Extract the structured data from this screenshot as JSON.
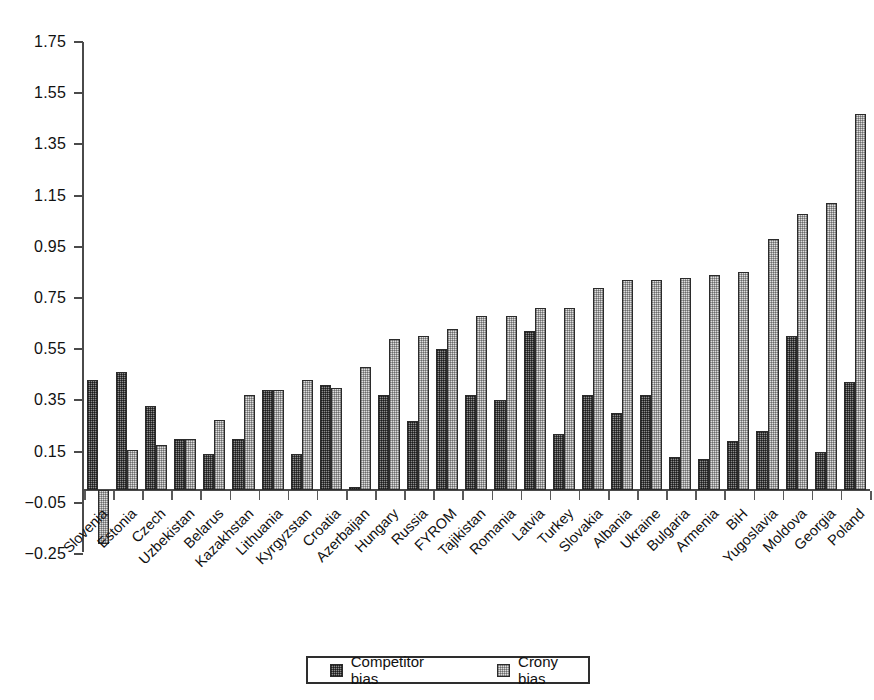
{
  "chart_data": {
    "type": "bar",
    "title": "",
    "subtitle": "",
    "xlabel": "",
    "ylabel": "",
    "ylim": [
      -0.25,
      1.75
    ],
    "yticks": [
      1.75,
      1.55,
      1.35,
      1.15,
      0.95,
      0.75,
      0.55,
      0.35,
      0.15,
      -0.05,
      -0.25
    ],
    "ytick_labels": [
      "1.75",
      "1.55",
      "1.35",
      "1.15",
      "0.95",
      "0.75",
      "0.55",
      "0.35",
      "0.15",
      "−0.05",
      "−0.25"
    ],
    "grid": false,
    "legend_position": "bottom-center",
    "categories": [
      "Slovenia",
      "Estonia",
      "Czech",
      "Uzbekistan",
      "Belarus",
      "Kazakhstan",
      "Lithuania",
      "Kyrgyzstan",
      "Croatia",
      "Azerbaijan",
      "Hungary",
      "Russia",
      "FYROM",
      "Tajikistan",
      "Romania",
      "Latvia",
      "Turkey",
      "Slovakia",
      "Albania",
      "Ukraine",
      "Bulgaria",
      "Armenia",
      "BiH",
      "Yugoslavia",
      "Moldova",
      "Georgia",
      "Poland"
    ],
    "series": [
      {
        "name": "Competitor bias",
        "color": "#8d8d8d",
        "pattern": "dark-checker",
        "values": [
          0.43,
          0.46,
          0.33,
          0.2,
          0.14,
          0.2,
          0.39,
          0.14,
          0.41,
          0.01,
          0.37,
          0.27,
          0.55,
          0.37,
          0.35,
          0.62,
          0.22,
          0.37,
          0.3,
          0.37,
          0.13,
          0.12,
          0.19,
          0.23,
          0.6,
          0.15,
          0.42
        ]
      },
      {
        "name": "Crony bias",
        "color": "#dedede",
        "pattern": "light-checker",
        "values": [
          -0.21,
          0.155,
          0.175,
          0.2,
          0.275,
          0.37,
          0.39,
          0.43,
          0.4,
          0.48,
          0.59,
          0.6,
          0.63,
          0.68,
          0.68,
          0.71,
          0.71,
          0.79,
          0.82,
          0.82,
          0.83,
          0.84,
          0.85,
          0.98,
          1.08,
          1.12,
          1.47
        ]
      }
    ]
  },
  "legend": {
    "items": [
      {
        "label": "Competitor bias",
        "swatch": "dark-checker-swatch"
      },
      {
        "label": "Crony bias",
        "swatch": "light-checker-swatch"
      }
    ]
  }
}
